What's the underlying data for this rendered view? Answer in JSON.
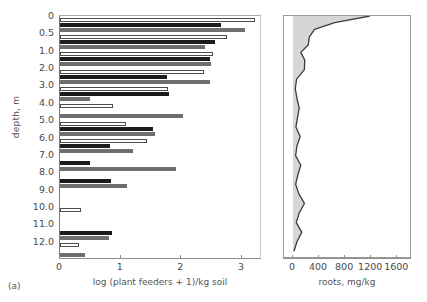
{
  "caption": "(a)",
  "axes": {
    "y": {
      "title": "depth, m",
      "ticks": [
        "0",
        "0.5",
        "1.0",
        "2.0",
        "3.0",
        "4.0",
        "5.0",
        "6.0",
        "7.0",
        "8.0",
        "9.0",
        "10.0",
        "11.0",
        "12.0"
      ],
      "values": [
        0,
        0.5,
        1.0,
        2.0,
        3.0,
        4.0,
        5.0,
        6.0,
        7.0,
        8.0,
        9.0,
        10.0,
        11.0,
        12.0
      ]
    },
    "left": {
      "title": "log (plant feeders + 1)/kg soil",
      "ticks": [
        "0",
        "1",
        "2",
        "3"
      ],
      "values": [
        0,
        1,
        2,
        3
      ],
      "range": [
        0,
        3.33
      ]
    },
    "right": {
      "title": "roots, mg/kg",
      "ticks": [
        "0",
        "400",
        "800",
        "1200",
        "1600"
      ],
      "values": [
        0,
        400,
        800,
        1200,
        1600
      ],
      "range": [
        0,
        1780
      ]
    }
  },
  "chart_data": [
    {
      "type": "bar",
      "orientation": "horizontal",
      "title": "",
      "xlabel": "log (plant feeders + 1)/kg soil",
      "ylabel": "depth, m",
      "xlim": [
        0,
        3.33
      ],
      "grid": false,
      "legend": "none",
      "categories": [
        "0",
        "0.5",
        "1.0",
        "2.0",
        "3.0",
        "4.0",
        "5.0",
        "6.0",
        "7.0",
        "8.0",
        "9.0",
        "10.0",
        "11.0",
        "12.0"
      ],
      "series": [
        {
          "name": "series-1-white",
          "color": "#ffffff",
          "values": [
            3.25,
            2.78,
            2.55,
            2.4,
            1.8,
            0.88,
            1.1,
            1.45,
            0.0,
            0.0,
            0.0,
            0.35,
            0.0,
            0.32
          ]
        },
        {
          "name": "series-2-black",
          "color": "#1c1c1c",
          "values": [
            2.68,
            2.58,
            2.5,
            1.78,
            1.82,
            0.0,
            1.55,
            0.83,
            0.5,
            0.85,
            0.0,
            0.0,
            0.87,
            0.0
          ]
        },
        {
          "name": "series-3-gray",
          "color": "#6e6e6e",
          "values": [
            3.08,
            2.42,
            2.52,
            2.5,
            0.5,
            2.05,
            1.58,
            1.22,
            1.93,
            1.12,
            0.0,
            0.0,
            0.82,
            0.42
          ]
        }
      ]
    },
    {
      "type": "area",
      "orientation": "horizontal",
      "title": "",
      "xlabel": "roots, mg/kg",
      "ylabel": "depth, m",
      "xlim": [
        0,
        1780
      ],
      "ylim": [
        0,
        12.6
      ],
      "grid": false,
      "legend": "none",
      "fill_color": "#d6d6d6",
      "line_color": "#3c3c3c",
      "depth": [
        0.0,
        0.35,
        0.7,
        1.1,
        1.5,
        1.9,
        2.3,
        2.8,
        3.3,
        3.8,
        4.3,
        4.8,
        5.3,
        5.8,
        6.3,
        6.8,
        7.3,
        7.8,
        8.3,
        8.8,
        9.3,
        9.8,
        10.3,
        10.8,
        11.3,
        11.8,
        12.3
      ],
      "roots": [
        1180,
        640,
        330,
        250,
        235,
        120,
        180,
        175,
        55,
        35,
        60,
        95,
        70,
        45,
        110,
        60,
        40,
        120,
        75,
        40,
        90,
        175,
        95,
        50,
        135,
        60,
        15
      ]
    }
  ]
}
